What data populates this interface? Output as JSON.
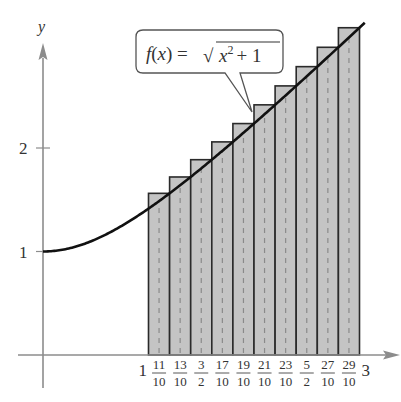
{
  "chart_data": {
    "type": "bar",
    "title": "",
    "xlabel": "",
    "ylabel": "y",
    "function_label": "f(x) = √(x² + 1)",
    "function_label_parts": {
      "lhs": "f(x) =",
      "radicand_base": "x",
      "exponent": "2",
      "tail": "+ 1"
    },
    "xlim": [
      0,
      3
    ],
    "ylim": [
      0,
      3.2
    ],
    "grid": false,
    "y_ticks": [
      {
        "value": 1,
        "label": "1"
      },
      {
        "value": 2,
        "label": "2"
      }
    ],
    "x_ticks": [
      {
        "value": 1,
        "label": "1"
      },
      {
        "value": 1.1,
        "num": "11",
        "den": "10"
      },
      {
        "value": 1.3,
        "num": "13",
        "den": "10"
      },
      {
        "value": 1.5,
        "num": "3",
        "den": "2"
      },
      {
        "value": 1.7,
        "num": "17",
        "den": "10"
      },
      {
        "value": 1.9,
        "num": "19",
        "den": "10"
      },
      {
        "value": 2.1,
        "num": "21",
        "den": "10"
      },
      {
        "value": 2.3,
        "num": "23",
        "den": "10"
      },
      {
        "value": 2.5,
        "num": "5",
        "den": "2"
      },
      {
        "value": 2.7,
        "num": "27",
        "den": "10"
      },
      {
        "value": 2.9,
        "num": "29",
        "den": "10"
      },
      {
        "value": 3,
        "label": "3"
      }
    ],
    "bars": {
      "x_left": [
        1.0,
        1.2,
        1.4,
        1.6,
        1.8,
        2.0,
        2.2,
        2.4,
        2.6,
        2.8
      ],
      "x_right": [
        1.2,
        1.4,
        1.6,
        1.8,
        2.0,
        2.2,
        2.4,
        2.6,
        2.8,
        3.0
      ],
      "values": [
        1.562,
        1.72,
        1.887,
        2.059,
        2.236,
        2.417,
        2.6,
        2.786,
        2.973,
        3.162
      ],
      "midpoints": [
        1.1,
        1.3,
        1.5,
        1.7,
        1.9,
        2.1,
        2.3,
        2.5,
        2.7,
        2.9
      ],
      "midpoint_values": [
        1.487,
        1.64,
        1.803,
        1.972,
        2.147,
        2.326,
        2.506,
        2.693,
        2.883,
        3.068
      ]
    },
    "curve": {
      "x_range": [
        0,
        3.05
      ],
      "formula": "sqrt(x^2+1)"
    },
    "colors": {
      "bar_fill": "#c4c4c4",
      "bar_stroke": "#2a2a2a",
      "curve": "#111111",
      "axis": "#888888",
      "dash": "#8a8a8a"
    }
  }
}
